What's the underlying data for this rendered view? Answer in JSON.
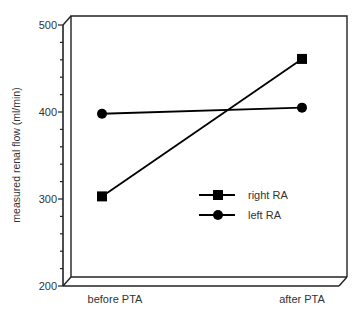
{
  "chart_data": {
    "type": "line",
    "title": "",
    "xlabel": "",
    "ylabel": "measured renal flow (ml/min)",
    "categories": [
      "before PTA",
      "after PTA"
    ],
    "series": [
      {
        "name": "right RA",
        "marker": "square",
        "values": [
          303,
          461
        ]
      },
      {
        "name": "left RA",
        "marker": "circle",
        "values": [
          398,
          405
        ]
      }
    ],
    "ylim": [
      200,
      500
    ],
    "yticks": [
      200,
      300,
      400,
      500
    ],
    "yticks_labels": [
      "200",
      "300",
      "400",
      "500"
    ],
    "minor_tick_step": 20,
    "grid": false,
    "legend_position": "inside-lower-right",
    "style": "3d-box-frame"
  },
  "labels": {
    "ylabel": "measured renal flow (ml/min)",
    "x0": "before PTA",
    "x1": "after PTA",
    "y500": "500",
    "y400": "400",
    "y300": "300",
    "y200": "200",
    "legend_right": "right RA",
    "legend_left": "left RA"
  },
  "colors": {
    "line": "#000000",
    "frame": "#222222",
    "text": "#333333"
  }
}
